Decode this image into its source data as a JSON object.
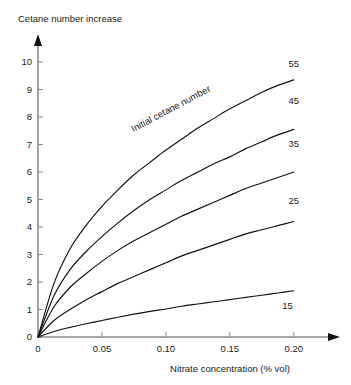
{
  "chart_data": {
    "type": "line",
    "title": "Cetane number increase",
    "xlabel": "Nitrate concentration (% vol)",
    "ylabel": "Cetane number increase",
    "xlim": [
      0,
      0.215
    ],
    "ylim": [
      0,
      10.4
    ],
    "grid": false,
    "legend_position": "inline-right-of-curve-ends",
    "annotations": [
      {
        "text": "Initial cetane number",
        "rotation": -28,
        "x": 0.105,
        "y": 8.2
      }
    ],
    "xticks": [
      0,
      0.05,
      0.1,
      0.15,
      0.2
    ],
    "xticklabels": [
      "0",
      "0.05",
      "0.10",
      "0.15",
      "0.20"
    ],
    "yticks": [
      0,
      1,
      2,
      3,
      4,
      5,
      6,
      7,
      8,
      9,
      10
    ],
    "yticklabels": [
      "0",
      "1",
      "2",
      "3",
      "4",
      "5",
      "6",
      "7",
      "8",
      "9",
      "10"
    ],
    "x": [
      0,
      0.0125,
      0.025,
      0.0375,
      0.05,
      0.0625,
      0.075,
      0.0875,
      0.1,
      0.1125,
      0.125,
      0.1375,
      0.15,
      0.1625,
      0.175,
      0.1875,
      0.2
    ],
    "series": [
      {
        "name": "55",
        "label": "55",
        "label_x": 0.2,
        "label_y": 9.95,
        "values": [
          0,
          1.95,
          3.2,
          4.05,
          4.75,
          5.35,
          5.9,
          6.35,
          6.8,
          7.2,
          7.6,
          7.95,
          8.3,
          8.6,
          8.9,
          9.15,
          9.35
        ]
      },
      {
        "name": "45",
        "label": "45",
        "label_x": 0.2,
        "label_y": 8.6,
        "values": [
          0,
          1.5,
          2.45,
          3.1,
          3.65,
          4.15,
          4.6,
          5.0,
          5.35,
          5.7,
          6.0,
          6.3,
          6.55,
          6.85,
          7.1,
          7.35,
          7.55
        ]
      },
      {
        "name": "35",
        "label": "35",
        "label_x": 0.2,
        "label_y": 7.05,
        "values": [
          0,
          1.1,
          1.8,
          2.3,
          2.75,
          3.15,
          3.5,
          3.8,
          4.1,
          4.4,
          4.65,
          4.9,
          5.15,
          5.4,
          5.6,
          5.8,
          6.0
        ]
      },
      {
        "name": "25",
        "label": "25",
        "label_x": 0.2,
        "label_y": 4.95,
        "values": [
          0,
          0.6,
          1.0,
          1.35,
          1.65,
          1.95,
          2.2,
          2.45,
          2.7,
          2.95,
          3.15,
          3.35,
          3.55,
          3.75,
          3.9,
          4.05,
          4.2
        ]
      },
      {
        "name": "15",
        "label": "15",
        "label_x": 0.195,
        "label_y": 1.15,
        "values": [
          0,
          0.2,
          0.35,
          0.48,
          0.6,
          0.72,
          0.83,
          0.93,
          1.02,
          1.12,
          1.2,
          1.28,
          1.36,
          1.44,
          1.52,
          1.6,
          1.68
        ]
      }
    ]
  }
}
